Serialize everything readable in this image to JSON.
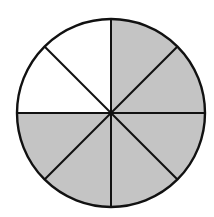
{
  "diagram": {
    "type": "fraction-circle",
    "total_parts": 8,
    "shaded_parts": 6,
    "unshaded_parts": 2,
    "fraction_shaded": "6/8",
    "center": [
      111,
      113
    ],
    "radius": 94,
    "colors": {
      "shaded": "#c4c4c4",
      "unshaded": "#ffffff",
      "stroke": "#111111",
      "background": "#ffffff"
    },
    "sectors": [
      {
        "index": 0,
        "from_deg": 0,
        "to_deg": 45,
        "shaded": true
      },
      {
        "index": 1,
        "from_deg": 45,
        "to_deg": 90,
        "shaded": true
      },
      {
        "index": 2,
        "from_deg": 90,
        "to_deg": 135,
        "shaded": true
      },
      {
        "index": 3,
        "from_deg": 135,
        "to_deg": 180,
        "shaded": true
      },
      {
        "index": 4,
        "from_deg": 180,
        "to_deg": 225,
        "shaded": true
      },
      {
        "index": 5,
        "from_deg": 225,
        "to_deg": 270,
        "shaded": true
      },
      {
        "index": 6,
        "from_deg": 270,
        "to_deg": 315,
        "shaded": false
      },
      {
        "index": 7,
        "from_deg": 315,
        "to_deg": 360,
        "shaded": false
      }
    ]
  }
}
